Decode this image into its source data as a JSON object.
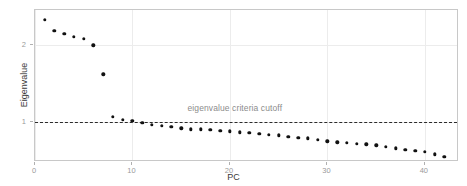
{
  "chart_data": {
    "type": "scatter",
    "title": "",
    "xlabel": "PC",
    "ylabel": "Eigenvalue",
    "xlim": [
      0,
      43.5
    ],
    "ylim": [
      0.47,
      2.46
    ],
    "xticks": [
      0,
      10,
      20,
      30,
      40
    ],
    "xtick_labels": [
      "0",
      "10",
      "20",
      "30",
      "40"
    ],
    "yticks": [
      1,
      2
    ],
    "ytick_labels": [
      "1",
      "2"
    ],
    "grid": true,
    "legend": "none",
    "marker": "filled-circle",
    "marker_color": "#111111",
    "x": [
      1,
      2,
      3,
      4,
      5,
      6,
      7,
      8,
      9,
      10,
      11,
      12,
      13,
      14,
      15,
      16,
      17,
      18,
      19,
      20,
      21,
      22,
      23,
      24,
      25,
      26,
      27,
      28,
      29,
      30,
      31,
      32,
      33,
      34,
      35,
      36,
      37,
      38,
      39,
      40,
      41,
      42
    ],
    "values": [
      2.33,
      2.19,
      2.15,
      2.11,
      2.08,
      2.0,
      1.62,
      1.06,
      1.02,
      1.01,
      0.98,
      0.96,
      0.94,
      0.93,
      0.91,
      0.9,
      0.9,
      0.89,
      0.88,
      0.87,
      0.86,
      0.85,
      0.84,
      0.83,
      0.82,
      0.8,
      0.79,
      0.78,
      0.76,
      0.74,
      0.73,
      0.72,
      0.71,
      0.7,
      0.69,
      0.67,
      0.65,
      0.63,
      0.62,
      0.6,
      0.57,
      0.54
    ],
    "annotations": [
      {
        "name": "eigenvalue-cutoff",
        "text": "eigenvalue criteria cutoff",
        "x": 20.5,
        "y": 1.175,
        "color": "#8c8c8c"
      }
    ],
    "reference_lines": [
      {
        "name": "eigenvalue-criteria-cutoff-line",
        "orientation": "horizontal",
        "y": 1,
        "style": "dashed",
        "color": "#2b2b2b"
      }
    ]
  },
  "axes": {
    "x_title": "PC",
    "y_title": "Eigenvalue"
  },
  "colors": {
    "panel_background": "#ffffff",
    "grid": "#ececec",
    "panel_border": "#c8c8c8",
    "tick_label": "#9a9a9a",
    "axis_title": "#3a3a3a",
    "point": "#111111",
    "annotation": "#8c8c8c"
  }
}
